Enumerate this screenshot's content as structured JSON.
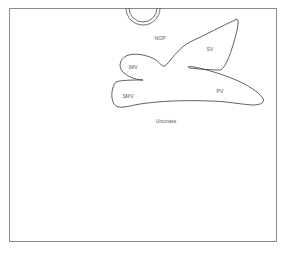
{
  "diagram": {
    "type": "anatomical-outline",
    "colors": {
      "background": "#ffffff",
      "stroke": "#3a3a3a",
      "frame": "#8a8a8a",
      "label": "#555555"
    },
    "labels": {
      "nop": "NOP",
      "sv": "SV",
      "imv": "IMV",
      "smv": "SMV",
      "pv": "PV",
      "uncinate": "Uncinate"
    }
  }
}
